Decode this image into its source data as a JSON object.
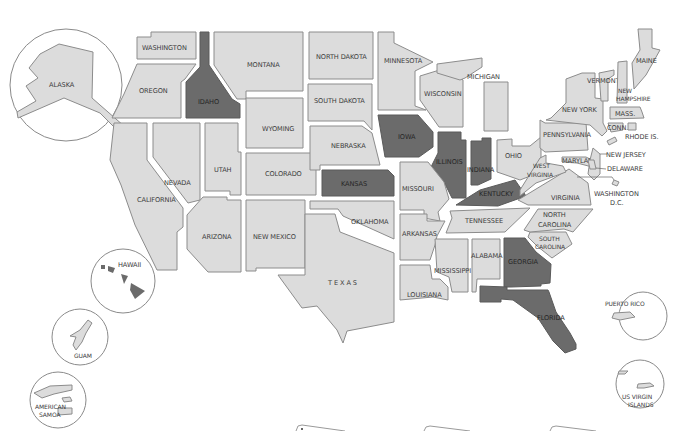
{
  "map": {
    "title": "United States map",
    "colors": {
      "background": "#ffffff",
      "state_fill": "#dcdcdc",
      "state_stroke": "#8c8c8c",
      "highlight_fill": "#6b6b6b",
      "label": "#3c3c3c"
    },
    "highlighted_states": [
      "IDAHO",
      "IOWA",
      "ILLINOIS",
      "INDIANA",
      "KANSAS",
      "KENTUCKY",
      "GEORGIA",
      "FLORIDA"
    ],
    "states": {
      "washington": "WASHINGTON",
      "oregon": "OREGON",
      "california": "CALIFORNIA",
      "idaho": "IDAHO",
      "nevada": "NEVADA",
      "montana": "MONTANA",
      "wyoming": "WYOMING",
      "utah": "UTAH",
      "colorado": "COLORADO",
      "arizona": "ARIZONA",
      "new_mexico": "NEW MEXICO",
      "north_dakota": "NORTH DAKOTA",
      "south_dakota": "SOUTH DAKOTA",
      "nebraska": "NEBRASKA",
      "kansas": "KANSAS",
      "oklahoma": "OKLAHOMA",
      "texas": "T E X A S",
      "minnesota": "MINNESOTA",
      "iowa": "IOWA",
      "missouri": "MISSOURI",
      "arkansas": "ARKANSAS",
      "louisiana": "LOUISIANA",
      "wisconsin": "WISCONSIN",
      "michigan": "MICHIGAN",
      "illinois": "ILLINOIS",
      "indiana": "INDIANA",
      "ohio": "OHIO",
      "kentucky": "KENTUCKY",
      "tennessee": "TENNESSEE",
      "mississippi": "MISSISSIPPI",
      "alabama": "ALABAMA",
      "georgia": "GEORGIA",
      "florida": "FLORIDA",
      "south_carolina_1": "SOUTH",
      "south_carolina_2": "CAROLINA",
      "north_carolina_1": "NORTH",
      "north_carolina_2": "CAROLINA",
      "virginia": "VIRGINIA",
      "west_virginia_1": "WEST",
      "west_virginia_2": "VIRGINIA",
      "pennsylvania": "PENNSYLVANIA",
      "new_york": "NEW YORK",
      "maryland": "MARYLAND",
      "delaware": "DELAWARE",
      "new_jersey": "NEW JERSEY",
      "washington_dc_1": "WASHINGTON",
      "washington_dc_2": "D.C.",
      "connecticut": "CONN.",
      "rhode_island": "RHODE IS.",
      "massachusetts": "MASS.",
      "vermont": "VERMONT",
      "new_hampshire_1": "NEW",
      "new_hampshire_2": "HAMPSHIRE",
      "maine": "MAINE"
    },
    "insets": {
      "alaska": "ALASKA",
      "hawaii": "HAWAII",
      "guam": "GUAM",
      "american_samoa_1": "AMERICAN",
      "american_samoa_2": "SAMOA",
      "puerto_rico": "PUERTO RICO",
      "us_virgin_islands_1": "US VIRGIN",
      "us_virgin_islands_2": "ISLANDS"
    }
  }
}
